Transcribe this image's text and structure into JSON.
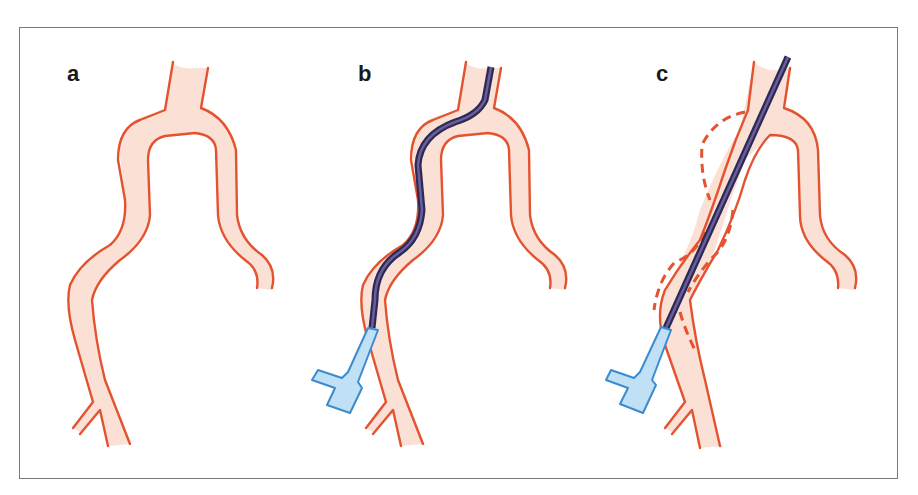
{
  "figure": {
    "panels": [
      {
        "id": "a",
        "label": "a",
        "description": "Aortic arch with branches, no instrument"
      },
      {
        "id": "b",
        "label": "b",
        "description": "Guidewire through sheath following vessel curvature"
      },
      {
        "id": "c",
        "label": "c",
        "description": "Straight stiff wire straightening the vessel; dashed outlines show original vessel position"
      }
    ],
    "colors": {
      "vessel_wall": "#e4532f",
      "vessel_lumen": "#fbe0d6",
      "guidewire": "#2c2a55",
      "sheath_fill": "#bfe0f5",
      "sheath_stroke": "#3b8bd0",
      "frame_border": "#7a7a7a"
    }
  }
}
